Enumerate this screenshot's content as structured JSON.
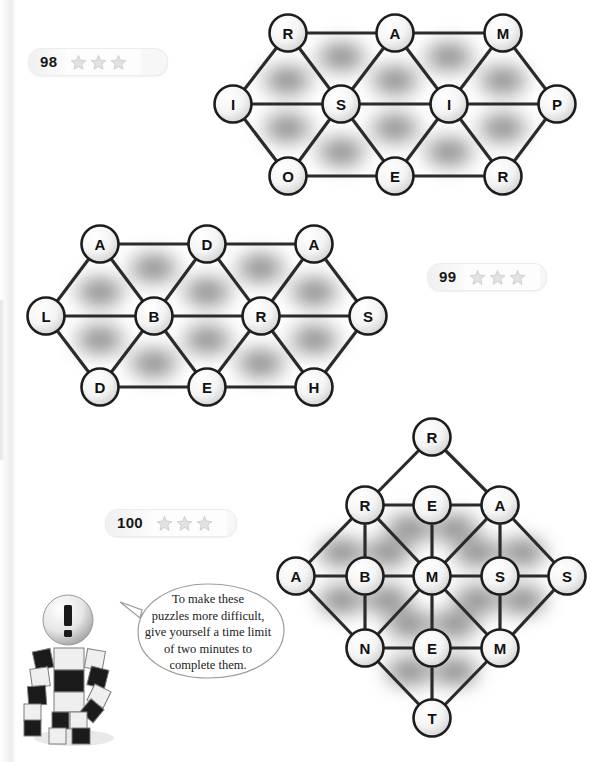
{
  "page": {
    "background_color": "#ffffff"
  },
  "badges": [
    {
      "number": "98",
      "stars": 3,
      "star_color": "#d8d8d8"
    },
    {
      "number": "99",
      "stars": 3,
      "star_color": "#d8d8d8"
    },
    {
      "number": "100",
      "stars": 3,
      "star_color": "#d8d8d8"
    }
  ],
  "puzzles": [
    {
      "id": "puzzle-98",
      "number": "98",
      "shape": "hexagonal-strip",
      "nodes": [
        {
          "id": "n1",
          "letter": "R",
          "x": 288,
          "y": 33
        },
        {
          "id": "n2",
          "letter": "A",
          "x": 395,
          "y": 33
        },
        {
          "id": "n3",
          "letter": "M",
          "x": 503,
          "y": 33
        },
        {
          "id": "n4",
          "letter": "I",
          "x": 233,
          "y": 104
        },
        {
          "id": "n5",
          "letter": "S",
          "x": 341,
          "y": 104
        },
        {
          "id": "n6",
          "letter": "I",
          "x": 449,
          "y": 104
        },
        {
          "id": "n7",
          "letter": "P",
          "x": 557,
          "y": 104
        },
        {
          "id": "n8",
          "letter": "O",
          "x": 288,
          "y": 176
        },
        {
          "id": "n9",
          "letter": "E",
          "x": 395,
          "y": 176
        },
        {
          "id": "n10",
          "letter": "R",
          "x": 503,
          "y": 176
        }
      ],
      "edges": [
        [
          "n1",
          "n2"
        ],
        [
          "n2",
          "n3"
        ],
        [
          "n4",
          "n5"
        ],
        [
          "n5",
          "n6"
        ],
        [
          "n6",
          "n7"
        ],
        [
          "n8",
          "n9"
        ],
        [
          "n9",
          "n10"
        ],
        [
          "n4",
          "n1"
        ],
        [
          "n1",
          "n5"
        ],
        [
          "n5",
          "n2"
        ],
        [
          "n2",
          "n6"
        ],
        [
          "n6",
          "n3"
        ],
        [
          "n3",
          "n7"
        ],
        [
          "n4",
          "n8"
        ],
        [
          "n8",
          "n5"
        ],
        [
          "n5",
          "n9"
        ],
        [
          "n9",
          "n6"
        ],
        [
          "n6",
          "n10"
        ],
        [
          "n10",
          "n7"
        ]
      ]
    },
    {
      "id": "puzzle-99",
      "number": "99",
      "shape": "hexagonal-strip",
      "nodes": [
        {
          "id": "n1",
          "letter": "A",
          "x": 100,
          "y": 244
        },
        {
          "id": "n2",
          "letter": "D",
          "x": 207,
          "y": 244
        },
        {
          "id": "n3",
          "letter": "A",
          "x": 314,
          "y": 244
        },
        {
          "id": "n4",
          "letter": "L",
          "x": 46,
          "y": 316
        },
        {
          "id": "n5",
          "letter": "B",
          "x": 154,
          "y": 316
        },
        {
          "id": "n6",
          "letter": "R",
          "x": 261,
          "y": 316
        },
        {
          "id": "n7",
          "letter": "S",
          "x": 368,
          "y": 316
        },
        {
          "id": "n8",
          "letter": "D",
          "x": 100,
          "y": 387
        },
        {
          "id": "n9",
          "letter": "E",
          "x": 207,
          "y": 387
        },
        {
          "id": "n10",
          "letter": "H",
          "x": 314,
          "y": 387
        }
      ],
      "edges": [
        [
          "n1",
          "n2"
        ],
        [
          "n2",
          "n3"
        ],
        [
          "n4",
          "n5"
        ],
        [
          "n5",
          "n6"
        ],
        [
          "n6",
          "n7"
        ],
        [
          "n8",
          "n9"
        ],
        [
          "n9",
          "n10"
        ],
        [
          "n4",
          "n1"
        ],
        [
          "n1",
          "n5"
        ],
        [
          "n5",
          "n2"
        ],
        [
          "n2",
          "n6"
        ],
        [
          "n6",
          "n3"
        ],
        [
          "n3",
          "n7"
        ],
        [
          "n4",
          "n8"
        ],
        [
          "n8",
          "n5"
        ],
        [
          "n5",
          "n9"
        ],
        [
          "n9",
          "n6"
        ],
        [
          "n6",
          "n10"
        ],
        [
          "n10",
          "n7"
        ]
      ]
    },
    {
      "id": "puzzle-100",
      "number": "100",
      "shape": "diamond-lattice",
      "nodes": [
        {
          "id": "d1",
          "letter": "R",
          "x": 432,
          "y": 437
        },
        {
          "id": "d2",
          "letter": "R",
          "x": 365,
          "y": 505
        },
        {
          "id": "d3",
          "letter": "E",
          "x": 432,
          "y": 505
        },
        {
          "id": "d4",
          "letter": "A",
          "x": 500,
          "y": 505
        },
        {
          "id": "d5",
          "letter": "A",
          "x": 296,
          "y": 576
        },
        {
          "id": "d6",
          "letter": "B",
          "x": 365,
          "y": 576
        },
        {
          "id": "d7",
          "letter": "M",
          "x": 432,
          "y": 576
        },
        {
          "id": "d8",
          "letter": "S",
          "x": 500,
          "y": 576
        },
        {
          "id": "d9",
          "letter": "S",
          "x": 567,
          "y": 576
        },
        {
          "id": "d10",
          "letter": "N",
          "x": 365,
          "y": 648
        },
        {
          "id": "d11",
          "letter": "E",
          "x": 432,
          "y": 648
        },
        {
          "id": "d12",
          "letter": "M",
          "x": 500,
          "y": 648
        },
        {
          "id": "d13",
          "letter": "T",
          "x": 432,
          "y": 718
        }
      ],
      "edges": [
        [
          "d2",
          "d3"
        ],
        [
          "d3",
          "d4"
        ],
        [
          "d5",
          "d6"
        ],
        [
          "d6",
          "d7"
        ],
        [
          "d7",
          "d8"
        ],
        [
          "d8",
          "d9"
        ],
        [
          "d10",
          "d11"
        ],
        [
          "d11",
          "d12"
        ],
        [
          "d2",
          "d6"
        ],
        [
          "d3",
          "d7"
        ],
        [
          "d4",
          "d8"
        ],
        [
          "d6",
          "d10"
        ],
        [
          "d7",
          "d11"
        ],
        [
          "d8",
          "d12"
        ],
        [
          "d1",
          "d2"
        ],
        [
          "d1",
          "d4"
        ],
        [
          "d2",
          "d5"
        ],
        [
          "d4",
          "d9"
        ],
        [
          "d5",
          "d10"
        ],
        [
          "d9",
          "d12"
        ],
        [
          "d10",
          "d13"
        ],
        [
          "d12",
          "d13"
        ],
        [
          "d11",
          "d13"
        ],
        [
          "d2",
          "d7"
        ],
        [
          "d4",
          "d7"
        ],
        [
          "d7",
          "d10"
        ],
        [
          "d7",
          "d12"
        ]
      ]
    }
  ],
  "tip": {
    "id": "tip-bubble",
    "lines": [
      "To make these",
      "puzzles more difficult,",
      "give yourself a time limit",
      "of two minutes to",
      "complete them."
    ],
    "text": "To make these puzzles more difficult, give yourself a time limit of two minutes to complete them."
  },
  "mascot": {
    "id": "robot-mascot",
    "description": "checkered block robot with exclamation mark head",
    "head_symbol": "!"
  }
}
